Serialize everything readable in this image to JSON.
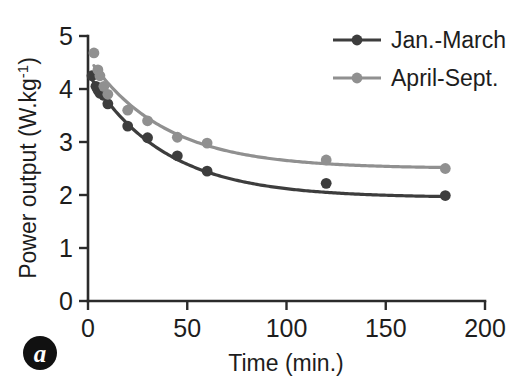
{
  "chart_data": {
    "type": "scatter",
    "title": "",
    "panel_label": "a",
    "xlabel": "Time (min.)",
    "ylabel": "Power output (W.kg-1)",
    "ylabel_display": "Power output (W.kg⁻¹)",
    "xlim": [
      0,
      200
    ],
    "ylim": [
      0,
      5
    ],
    "xticks": [
      0,
      50,
      100,
      150,
      200
    ],
    "yticks": [
      0,
      1,
      2,
      3,
      4,
      5
    ],
    "xtick_labels": [
      "0",
      "50",
      "100",
      "150",
      "200"
    ],
    "ytick_labels": [
      "0",
      "1",
      "2",
      "3",
      "4",
      "5"
    ],
    "grid": false,
    "legend_position": "top-right",
    "series": [
      {
        "name": "Jan.-March",
        "color": "#3d3d3d",
        "marker": "circle",
        "has_fit_curve": true,
        "x": [
          2,
          4,
          5,
          6,
          8,
          10,
          20,
          30,
          45,
          60,
          120,
          180
        ],
        "y": [
          4.25,
          4.05,
          3.98,
          3.92,
          3.88,
          3.72,
          3.3,
          3.08,
          2.74,
          2.45,
          2.22,
          1.99
        ],
        "fit_asymptote": 1.95,
        "fit_amplitude": 2.35,
        "fit_tau": 38
      },
      {
        "name": "April-Sept.",
        "color": "#909090",
        "marker": "circle",
        "has_fit_curve": true,
        "x": [
          3,
          5,
          6,
          8,
          10,
          20,
          30,
          45,
          60,
          120,
          180
        ],
        "y": [
          4.68,
          4.36,
          4.25,
          4.05,
          3.9,
          3.6,
          3.4,
          3.09,
          2.98,
          2.66,
          2.5
        ],
        "fit_asymptote": 2.5,
        "fit_amplitude": 2.1,
        "fit_tau": 38
      }
    ]
  },
  "axes": {
    "x_axis_title": "Time (min.)",
    "y_axis_title": "Power output (W.kg⁻¹)",
    "y_axis_base": "Power output (W.kg",
    "y_axis_sup": "-1",
    "y_axis_tail": ")"
  },
  "legend": {
    "entries": [
      {
        "label": "Jan.-March",
        "color": "#3d3d3d"
      },
      {
        "label": "April-Sept.",
        "color": "#909090"
      }
    ]
  },
  "panel": {
    "letter": "a",
    "badge_color": "#111111",
    "letter_color": "#ffffff"
  },
  "colors": {
    "series_dark": "#3d3d3d",
    "series_light": "#909090",
    "axis": "#2b2b2b",
    "text": "#1d1d1d",
    "background": "#ffffff"
  }
}
